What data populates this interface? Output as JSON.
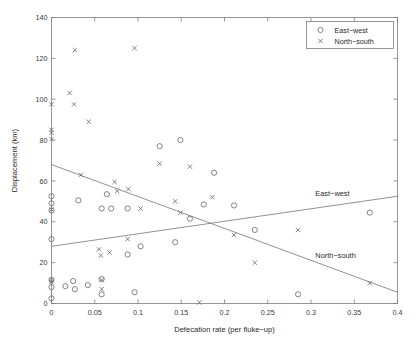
{
  "chart_data": {
    "type": "scatter",
    "title": "",
    "xlabel": "Defecation rate (per fluke−up)",
    "ylabel": "Displacement (km)",
    "xlim": [
      0,
      0.4
    ],
    "ylim": [
      0,
      140
    ],
    "xticks": [
      0,
      0.05,
      0.1,
      0.15,
      0.2,
      0.25,
      0.3,
      0.35,
      0.4
    ],
    "xticklabels": [
      "0",
      "0.05",
      "0.1",
      "0.15",
      "0.2",
      "0.25",
      "0.3",
      "0.35",
      "0.4"
    ],
    "yticks": [
      0,
      20,
      40,
      60,
      80,
      100,
      120,
      140
    ],
    "yticklabels": [
      "0",
      "20",
      "40",
      "60",
      "80",
      "100",
      "120",
      "140"
    ],
    "grid": false,
    "legend_position": "top-right",
    "series": [
      {
        "name": "East−west",
        "marker": "circle",
        "points": [
          [
            0.0,
            52.5
          ],
          [
            0.0,
            49.0
          ],
          [
            0.0,
            45.5
          ],
          [
            0.0,
            31.5
          ],
          [
            0.0,
            11.5
          ],
          [
            0.0,
            8.0
          ],
          [
            0.0,
            2.5
          ],
          [
            0.016,
            8.5
          ],
          [
            0.025,
            11.0
          ],
          [
            0.027,
            7.0
          ],
          [
            0.031,
            50.5
          ],
          [
            0.042,
            9.0
          ],
          [
            0.058,
            46.5
          ],
          [
            0.058,
            12.0
          ],
          [
            0.058,
            4.5
          ],
          [
            0.064,
            53.5
          ],
          [
            0.069,
            46.5
          ],
          [
            0.088,
            46.5
          ],
          [
            0.088,
            24.0
          ],
          [
            0.096,
            5.5
          ],
          [
            0.103,
            28.0
          ],
          [
            0.125,
            77.0
          ],
          [
            0.149,
            80.0
          ],
          [
            0.143,
            30.0
          ],
          [
            0.16,
            41.5
          ],
          [
            0.176,
            48.5
          ],
          [
            0.188,
            64.0
          ],
          [
            0.211,
            48.0
          ],
          [
            0.235,
            36.0
          ],
          [
            0.285,
            4.5
          ],
          [
            0.368,
            44.5
          ]
        ]
      },
      {
        "name": "North−south",
        "marker": "cross",
        "points": [
          [
            0.0,
            97.5
          ],
          [
            0.0,
            85.0
          ],
          [
            0.0,
            83.5
          ],
          [
            0.0,
            80.5
          ],
          [
            0.0,
            46.0
          ],
          [
            0.0,
            11.5
          ],
          [
            0.0,
            10.5
          ],
          [
            0.021,
            103.0
          ],
          [
            0.026,
            97.5
          ],
          [
            0.027,
            124.0
          ],
          [
            0.043,
            89.0
          ],
          [
            0.034,
            63.0
          ],
          [
            0.055,
            26.5
          ],
          [
            0.057,
            23.5
          ],
          [
            0.058,
            11.5
          ],
          [
            0.058,
            7.0
          ],
          [
            0.067,
            25.0
          ],
          [
            0.073,
            59.5
          ],
          [
            0.076,
            55.0
          ],
          [
            0.088,
            31.5
          ],
          [
            0.089,
            56.0
          ],
          [
            0.096,
            125.0
          ],
          [
            0.103,
            46.5
          ],
          [
            0.125,
            68.5
          ],
          [
            0.143,
            50.0
          ],
          [
            0.149,
            44.5
          ],
          [
            0.16,
            67.0
          ],
          [
            0.171,
            0.5
          ],
          [
            0.186,
            52.0
          ],
          [
            0.211,
            33.5
          ],
          [
            0.235,
            20.0
          ],
          [
            0.285,
            36.0
          ],
          [
            0.368,
            10.0
          ]
        ]
      }
    ],
    "fit_lines": [
      {
        "name": "East−west",
        "label": "East−west",
        "x_start": 0.0,
        "y_start": 28.0,
        "x_end": 0.4,
        "y_end": 52.5,
        "label_x": 0.305,
        "label_y": 52.5
      },
      {
        "name": "North−south",
        "label": "North−south",
        "x_start": 0.0,
        "y_start": 68.0,
        "x_end": 0.4,
        "y_end": 5.5,
        "label_x": 0.305,
        "label_y": 22.5
      }
    ],
    "legend": [
      {
        "label": "East−west",
        "marker": "circle"
      },
      {
        "label": "North−south",
        "marker": "cross"
      }
    ],
    "colors": {
      "axis": "#7d7d7d",
      "marker": "#5c5c5c",
      "line": "#6e6e6e",
      "text": "#2b2b2b",
      "background": "#ffffff"
    }
  }
}
